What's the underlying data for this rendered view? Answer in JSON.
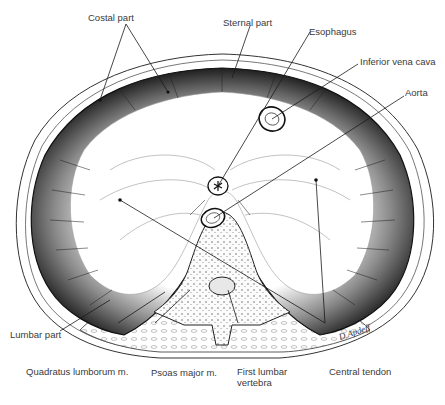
{
  "diagram": {
    "labels": {
      "costal_part": "Costal part",
      "sternal_part": "Sternal part",
      "esophagus": "Esophagus",
      "inferior_vena_cava": "Inferior vena cava",
      "aorta": "Aorta",
      "lumbar_part": "Lumbar part",
      "quadratus_lumborum": "Quadratus lumborum m.",
      "psoas_major": "Psoas major m.",
      "first_lumbar_vertebra": "First lumbar vertebra",
      "central_tendon": "Central tendon"
    },
    "signature": "D.Apdeff",
    "colors": {
      "line": "#1a1a1a",
      "muscle_dark": "#2b2b2b",
      "muscle_mid": "#7a7a7a",
      "tendon": "#ffffff",
      "text": "#3a3a3a"
    }
  }
}
